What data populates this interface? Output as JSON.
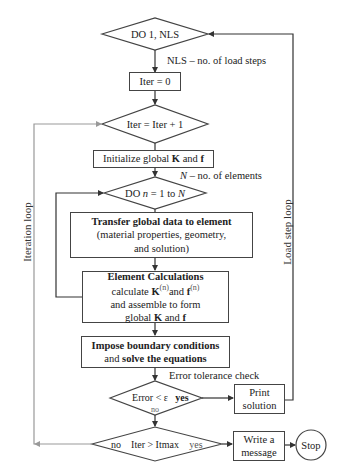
{
  "flowchart": {
    "load_loop_decision": {
      "text": "DO 1, NLS"
    },
    "nls_note": "NLS – no. of load steps",
    "iter_init": {
      "text": "Iter = 0"
    },
    "iter_increment": {
      "text": "Iter = Iter + 1"
    },
    "initialize": {
      "text_prefix": "Initialize global ",
      "K": "K",
      "and": " and ",
      "f": "f"
    },
    "n_note": {
      "N": "N",
      "rest": " – no. of elements"
    },
    "element_loop": {
      "prefix": "DO ",
      "n": "n",
      "mid": " = 1 to ",
      "N": "N"
    },
    "transfer": {
      "title": "Transfer global data to element",
      "line2": "(material properties, geometry,",
      "line3": "and solution)"
    },
    "element_calc": {
      "title": "Element Calculations",
      "line2_prefix": "calculate ",
      "K": "K",
      "sup": "(n)",
      "and": "and ",
      "f": "f",
      "line3": "and assemble to form",
      "line4_prefix": "global  ",
      "line4_K": "K",
      "line4_and": " and ",
      "line4_f": "f"
    },
    "impose": {
      "line1": "Impose boundary conditions",
      "line2_and": "and ",
      "line2_bold": "solve the equations"
    },
    "tolerance_note": "Error tolerance check",
    "error_decision": {
      "text": "Error < ε",
      "yes": "yes",
      "no": "no"
    },
    "print_solution": {
      "line1": "Print",
      "line2": "solution"
    },
    "itmax_decision": {
      "no": "no",
      "text": "Iter > Itmax",
      "yes": "yes"
    },
    "write_message": {
      "line1": "Write a",
      "line2": "message"
    },
    "stop": {
      "text": "Stop"
    },
    "iteration_loop_label": "Iteration loop",
    "load_step_loop_label": "Load step loop"
  }
}
